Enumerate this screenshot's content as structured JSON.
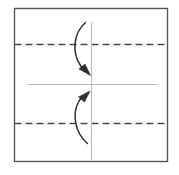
{
  "figure": {
    "title": "Origami fold step diagram",
    "background_color": "#ffffff",
    "canvas": {
      "width": 179,
      "height": 175
    }
  },
  "paper": {
    "name": "square-sheet",
    "x": 14.5,
    "y": 8.5,
    "width": 153,
    "height": 153,
    "stroke_color": "#58585a",
    "stroke_width": 1.4,
    "fill_color": "#ffffff"
  },
  "fold_lines": [
    {
      "name": "upper-fold-line",
      "type": "dashed",
      "orientation": "horizontal",
      "y": 44.5,
      "x1": 14.5,
      "x2": 167.5,
      "stroke_color": "#4a4a4c",
      "stroke_width": 1.3,
      "dash_pattern": "7 4"
    },
    {
      "name": "lower-fold-line",
      "type": "dashed",
      "orientation": "horizontal",
      "y": 123.5,
      "x1": 14.5,
      "x2": 167.5,
      "stroke_color": "#4a4a4c",
      "stroke_width": 1.3,
      "dash_pattern": "7 4"
    }
  ],
  "reference_lines": [
    {
      "name": "horizontal-center-line",
      "type": "solid",
      "orientation": "horizontal",
      "y": 84.5,
      "x1": 28,
      "x2": 158,
      "stroke_color": "#b9b9bb",
      "stroke_width": 1.2
    },
    {
      "name": "vertical-center-line",
      "type": "solid",
      "orientation": "vertical",
      "x": 91.5,
      "y1": 22,
      "y2": 160,
      "stroke_color": "#c0c0c2",
      "stroke_width": 1.2
    }
  ],
  "arrows": [
    {
      "name": "fold-down-arrow",
      "direction": "down",
      "meaning": "fold top edge down to center",
      "path": "M 85.5 22.5 C 73.5 33 71.5 52 80.5 65.5 C 83 69.5 86 71.5 88.5 72.5",
      "head_points": "89.5,74.5 80.5,69.5 86.0,65.0",
      "stroke_color": "#2e2e30",
      "stroke_width": 1.5
    },
    {
      "name": "fold-up-arrow",
      "direction": "up",
      "meaning": "fold bottom edge up to center",
      "path": "M 87.5 143.5 C 75.0 133 71.5 114 79.0 101.0 C 82.0 96.5 85.5 94.5 88.0 93.5",
      "head_points": "89.5,92.0 80.5,96.0 86.0,101.0",
      "stroke_color": "#2e2e30",
      "stroke_width": 1.5
    }
  ]
}
